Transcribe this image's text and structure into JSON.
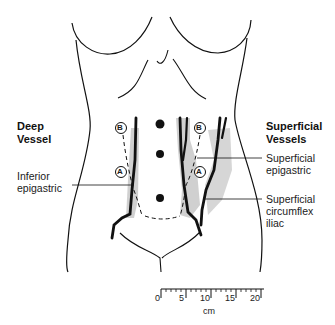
{
  "figure": {
    "type": "anatomical line drawing"
  },
  "headings": {
    "left": [
      "Deep",
      "Vessel"
    ],
    "right": [
      "Superficial",
      "Vessels"
    ]
  },
  "labels": {
    "inferior_epigastric": [
      "Inferior",
      "epigastric"
    ],
    "superficial_epigastric": [
      "Superficial",
      "epigastric"
    ],
    "superficial_circumflex_iliac": [
      "Superficial",
      "circumflex",
      "iliac"
    ]
  },
  "markers": {
    "a": "A",
    "b": "B"
  },
  "scale": {
    "ticks": [
      "0",
      "5",
      "10",
      "15",
      "20"
    ],
    "unit": "cm"
  },
  "colors": {
    "line": "#111111",
    "shade": "#c8c8c8"
  }
}
